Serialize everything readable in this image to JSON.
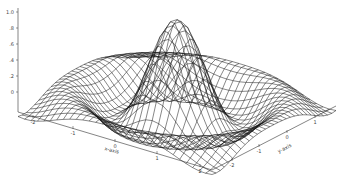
{
  "chart_data": {
    "type": "surface-wireframe",
    "title": "",
    "function": "sin(r)/r (sinc surface)",
    "xlabel": "x-axis",
    "ylabel": "y-axis",
    "zlabel": "",
    "x_ticks": [
      "-2",
      "-1",
      "0",
      "1",
      "2"
    ],
    "y_ticks": [
      "-2",
      "-1",
      "0",
      "1"
    ],
    "z_ticks": [
      "1.0",
      ".8",
      ".6",
      ".4",
      ".2",
      "0"
    ],
    "xlim": [
      -2.5,
      2.5
    ],
    "ylim": [
      -2.5,
      2.5
    ],
    "zlim": [
      -0.2,
      1.0
    ],
    "grid_resolution": 30,
    "peak": {
      "x": 0,
      "y": 0,
      "z": 1.0
    },
    "line_color": "#111111",
    "background": "#ffffff"
  }
}
